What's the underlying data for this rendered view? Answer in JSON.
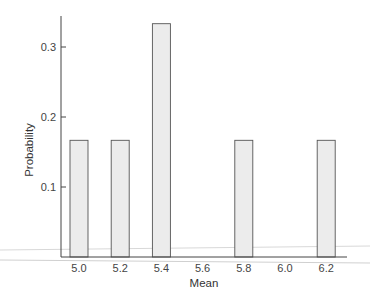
{
  "chart_data": {
    "type": "bar",
    "title": "",
    "xlabel": "Mean",
    "ylabel": "Probability",
    "categories": [
      "5.0",
      "5.2",
      "5.4",
      "5.6",
      "5.8",
      "6.0",
      "6.2"
    ],
    "values": [
      0.1667,
      0.1667,
      0.3333,
      0,
      0.1667,
      0,
      0.1667
    ],
    "x_ticks": [
      "5.0",
      "5.2",
      "5.4",
      "5.6",
      "5.8",
      "6.0",
      "6.2"
    ],
    "y_ticks": [
      "0.1",
      "0.2",
      "0.3"
    ],
    "ylim": [
      0,
      0.35
    ],
    "grid": false,
    "legend": null,
    "bar_color": "#ececec",
    "edge_color": "#555555"
  }
}
